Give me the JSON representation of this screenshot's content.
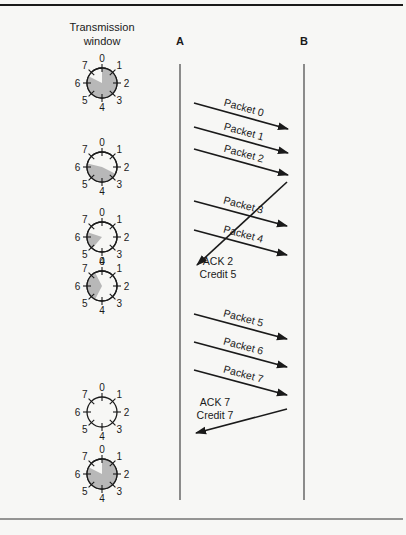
{
  "header": {
    "window_title_line1": "Transmission",
    "window_title_line2": "window",
    "station_a": "A",
    "station_b": "B"
  },
  "colors": {
    "ink": "#1a1a1a",
    "shade": "#b8b8b8",
    "background": "#f7f7f5"
  },
  "dial_labels": [
    "0",
    "1",
    "2",
    "3",
    "4",
    "5",
    "6",
    "7"
  ],
  "dials": [
    {
      "id": "dial-1",
      "shaded_from": 0,
      "shaded_to": 6.6,
      "description": "window 0-6"
    },
    {
      "id": "dial-2",
      "shaded_from": 2.6,
      "shaded_to": 6.3,
      "description": "window 3-6"
    },
    {
      "id": "dial-3",
      "shaded_from": 4.9,
      "shaded_to": 6.4,
      "description": "window 5-6"
    },
    {
      "id": "dial-4",
      "shaded_from": 4.6,
      "shaded_to": 7.4,
      "description": "window 5-1"
    },
    {
      "id": "dial-5",
      "shaded_from": null,
      "shaded_to": null,
      "description": "window closed"
    },
    {
      "id": "dial-6",
      "shaded_from": 0,
      "shaded_to": 6.6,
      "description": "window 0-6"
    }
  ],
  "messages": [
    {
      "label": "Packet 0",
      "direction": "A-to-B"
    },
    {
      "label": "Packet 1",
      "direction": "A-to-B"
    },
    {
      "label": "Packet 2",
      "direction": "A-to-B"
    },
    {
      "label": "Packet 3",
      "direction": "A-to-B"
    },
    {
      "label": "Packet 4",
      "direction": "A-to-B"
    },
    {
      "label_line1": "ACK 2",
      "label_line2": "Credit 5",
      "direction": "B-to-A"
    },
    {
      "label": "Packet 5",
      "direction": "A-to-B"
    },
    {
      "label": "Packet 6",
      "direction": "A-to-B"
    },
    {
      "label": "Packet 7",
      "direction": "A-to-B"
    },
    {
      "label_line1": "ACK 7",
      "label_line2": "Credit 7",
      "direction": "B-to-A"
    }
  ]
}
